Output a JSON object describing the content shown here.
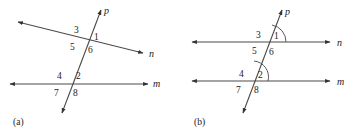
{
  "figure": {
    "type": "geometry-diagram",
    "panels": [
      {
        "id": "a",
        "caption": "(a)",
        "line_labels": {
          "transversal": "p",
          "upper_line": "n",
          "lower_line": "m"
        },
        "angle_labels": {
          "upper": [
            "3",
            "1",
            "5",
            "6"
          ],
          "lower": [
            "4",
            "2",
            "7",
            "8"
          ]
        },
        "arcs": []
      },
      {
        "id": "b",
        "caption": "(b)",
        "line_labels": {
          "transversal": "p",
          "upper_line": "n",
          "lower_line": "m"
        },
        "angle_labels": {
          "upper": [
            "3",
            "1",
            "5",
            "6"
          ],
          "lower": [
            "4",
            "2",
            "7",
            "8"
          ]
        },
        "arcs": [
          "1",
          "2"
        ]
      }
    ],
    "colors": {
      "line": "#4a4a4a",
      "text": "#1a1a1a",
      "background": "#ffffff"
    }
  },
  "panel_a": {
    "caption": "(a)",
    "label_p": "p",
    "label_n": "n",
    "label_m": "m",
    "a1": "1",
    "a2": "2",
    "a3": "3",
    "a4": "4",
    "a5": "5",
    "a6": "6",
    "a7": "7",
    "a8": "8"
  },
  "panel_b": {
    "caption": "(b)",
    "label_p": "p",
    "label_n": "n",
    "label_m": "m",
    "a1": "1",
    "a2": "2",
    "a3": "3",
    "a4": "4",
    "a5": "5",
    "a6": "6",
    "a7": "7",
    "a8": "8"
  }
}
